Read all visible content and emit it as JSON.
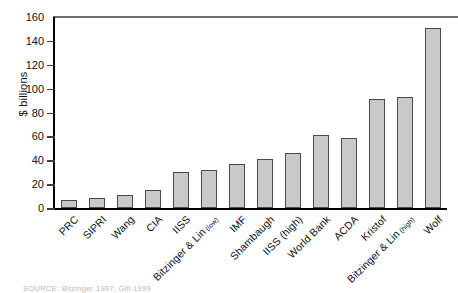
{
  "chart_data": {
    "type": "bar",
    "title": "",
    "subtitle": "",
    "xlabel": "",
    "ylabel": "$ billions",
    "ylim": [
      0,
      160
    ],
    "yticks": [
      0,
      20,
      40,
      60,
      80,
      100,
      120,
      140,
      160
    ],
    "grid": false,
    "legend": null,
    "bar_color": "#c9c9c9",
    "bar_edge_color": "#4a4a4a",
    "categories": [
      "PRC",
      "SIPRI",
      "Wang",
      "CIA",
      "IISS",
      "Bitzinger & Lin (low)",
      "IMF",
      "Shambaugh",
      "IISS (high)",
      "World Bank",
      "ACDA",
      "Kristof",
      "Bitzinger & Lin (high)",
      "Wolf"
    ],
    "category_main": [
      "PRC",
      "SIPRI",
      "Wang",
      "CIA",
      "IISS",
      "Bitzinger & Lin",
      "IMF",
      "Shambaugh",
      "IISS (high)",
      "World Bank",
      "ACDA",
      "Kristof",
      "Bitzinger & Lin",
      "Wolf"
    ],
    "category_sub": [
      "",
      "",
      "",
      "",
      "",
      "(low)",
      "",
      "",
      "",
      "",
      "",
      "",
      "(high)",
      ""
    ],
    "values": [
      7,
      8,
      11,
      15,
      30,
      32,
      37,
      41,
      46,
      61,
      59,
      91,
      93,
      151
    ]
  },
  "source": {
    "text": "SOURCE: Bitzinger 1997; Gill 1999"
  }
}
